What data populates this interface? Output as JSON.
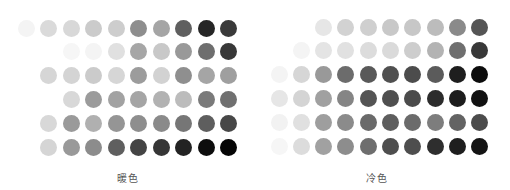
{
  "panels": [
    {
      "label": "暖色",
      "label_center_x": 128,
      "origin_x": 26,
      "origin_y": 28,
      "col_step": 22.5,
      "row_step": 23.8,
      "rows": [
        [
          "#f4f4f4",
          "#dadada",
          "#d8d8d8",
          "#cbcbcb",
          "#cdcdcd",
          "#8e8e8e",
          "#a5a5a5",
          "#5f5f5f",
          "#262626",
          "#3a3a3a"
        ],
        [
          null,
          null,
          "#f6f6f6",
          "#f4f4f4",
          "#e0e0e0",
          "#a6a6a6",
          "#c8c8c8",
          "#999999",
          "#6e6e6e",
          "#383838"
        ],
        [
          null,
          "#d6d6d6",
          "#d4d4d4",
          "#cbcbcb",
          "#d6d6d6",
          "#9c9c9c",
          "#d2d2d2",
          "#8f8f8f",
          "#a5a5a5",
          "#9f9f9f"
        ],
        [
          null,
          null,
          "#d8d8d8",
          "#9b9b9b",
          "#a2a2a2",
          "#a5a5a5",
          "#b2b2b2",
          "#bcbcbc",
          "#7a7a7a",
          "#707070"
        ],
        [
          null,
          "#d8d8d8",
          "#9a9a9a",
          "#b0b0b0",
          "#959595",
          "#8e8e8e",
          "#8a8a8a",
          "#767676",
          "#5e5e5e",
          "#474747"
        ],
        [
          null,
          "#d5d5d5",
          "#999999",
          "#8c8c8c",
          "#5f5f5f",
          "#444444",
          "#363636",
          "#232323",
          "#0d0d0d",
          "#060606"
        ]
      ]
    },
    {
      "label": "冷色",
      "label_center_x": 377,
      "origin_x": 279,
      "origin_y": 27,
      "col_step": 22.3,
      "row_step": 23.8,
      "rows": [
        [
          null,
          null,
          "#e6e6e6",
          "#d2d2d2",
          "#cfcfcf",
          "#c8c8c8",
          "#c7c7c7",
          "#bcbcbc",
          "#8a8a8a",
          "#555555"
        ],
        [
          null,
          "#f4f4f4",
          "#e4e4e4",
          "#e1e1e1",
          "#dcdcdc",
          "#dadada",
          "#cdcdcd",
          "#b3b3b3",
          "#6f6f6f",
          "#383838"
        ],
        [
          "#f4f4f4",
          "#d6d6d6",
          "#999999",
          "#6c6c6c",
          "#595959",
          "#505050",
          "#4c4c4c",
          "#5b5b5b",
          "#1e1e1e",
          "#0c0c0c"
        ],
        [
          "#e6e6e6",
          "#d4d4d4",
          "#a0a0a0",
          "#858585",
          "#545454",
          "#4f4f4f",
          "#4b4b4b",
          "#2c2c2c",
          "#1d1d1d",
          "#111111"
        ],
        [
          "#f2f2f2",
          "#e0e0e0",
          "#9e9e9e",
          "#8b8b8b",
          "#6a6a6a",
          "#5e5e5e",
          "#6b6b6b",
          "#7d7d7d",
          "#636363",
          "#4c4c4c"
        ],
        [
          "#f6f6f6",
          "#dcdcdc",
          "#a1a1a1",
          "#8d8d8d",
          "#6e6e6e",
          "#4e4e4e",
          "#4e4e4e",
          "#2e2e2e",
          "#1e1e1e",
          "#141414"
        ]
      ]
    }
  ]
}
